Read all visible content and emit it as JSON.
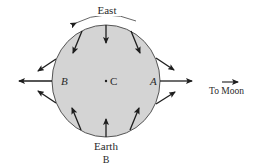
{
  "figure": {
    "type": "tidal-force-diagram",
    "body_label": "Earth",
    "caption_letter": "B",
    "direction_label": "East",
    "moon_label": "To Moon",
    "points": {
      "near_side": "A",
      "far_side": "B",
      "center": "C"
    },
    "colors": {
      "body_fill": "#d4d4d4",
      "outline": "#555555",
      "arrow": "#1e1e1e",
      "text": "#2a2a2a"
    },
    "tidal_arrows": [
      {
        "name": "arrow-top",
        "direction": "inward"
      },
      {
        "name": "arrow-top-left",
        "direction": "inward"
      },
      {
        "name": "arrow-top-right",
        "direction": "inward"
      },
      {
        "name": "arrow-bottom",
        "direction": "inward"
      },
      {
        "name": "arrow-bottom-left",
        "direction": "inward"
      },
      {
        "name": "arrow-bottom-right",
        "direction": "inward"
      },
      {
        "name": "arrow-left",
        "direction": "outward"
      },
      {
        "name": "arrow-upper-left",
        "direction": "outward"
      },
      {
        "name": "arrow-lower-left",
        "direction": "outward"
      },
      {
        "name": "arrow-right",
        "direction": "outward"
      },
      {
        "name": "arrow-upper-right",
        "direction": "outward"
      },
      {
        "name": "arrow-lower-right",
        "direction": "outward"
      }
    ]
  }
}
